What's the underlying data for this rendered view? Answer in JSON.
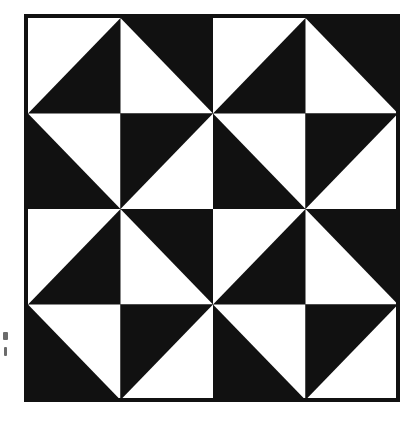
{
  "figure": {
    "title": "Half-Square Triangle Pinwheel Quilt Block",
    "description": "Monochrome scanned line-art diagram of a four-by-four grid of half-square triangle units forming interlocking pinwheel motifs.",
    "caption": ""
  },
  "canvas": {
    "width": 412,
    "height": 423,
    "background_color": "#ffffff"
  },
  "border": {
    "name": "outer-frame",
    "x": 26,
    "y": 16,
    "width": 372,
    "height": 384,
    "stroke_color": "#111111",
    "stroke_width": 4,
    "fill": "none"
  },
  "grid": {
    "rows": 4,
    "columns": 4,
    "origin_x": 28,
    "origin_y": 18,
    "cell_width": 92.5,
    "cell_height": 95.5,
    "ink_color": "#111111",
    "paper_color": "#ffffff",
    "unit_type": "half-square-triangle"
  },
  "legend": {
    "ink_label": "black",
    "paper_label": "white",
    "ink_color": "#111111",
    "paper_color": "#ffffff"
  },
  "chart_data": {
    "type": "heatmap",
    "title": "Half-Square Triangle Pinwheel Quilt Block",
    "xlabel": "",
    "ylabel": "",
    "rows": 4,
    "columns": 4,
    "categories": [
      "col-1",
      "col-2",
      "col-3",
      "col-4"
    ],
    "row_labels": [
      "row-1",
      "row-2",
      "row-3",
      "row-4"
    ],
    "value_key": "white_triangle_corner",
    "legend_position": "none",
    "grid": false,
    "cells": [
      [
        {
          "row": 0,
          "col": 0,
          "white_corner": "top-left",
          "black_corner": "bottom-right",
          "diagonal": "anti"
        },
        {
          "row": 0,
          "col": 1,
          "white_corner": "bottom-left",
          "black_corner": "top-right",
          "diagonal": "main"
        },
        {
          "row": 0,
          "col": 2,
          "white_corner": "top-left",
          "black_corner": "bottom-right",
          "diagonal": "anti"
        },
        {
          "row": 0,
          "col": 3,
          "white_corner": "bottom-left",
          "black_corner": "top-right",
          "diagonal": "main"
        }
      ],
      [
        {
          "row": 1,
          "col": 0,
          "white_corner": "top-right",
          "black_corner": "bottom-left",
          "diagonal": "main"
        },
        {
          "row": 1,
          "col": 1,
          "white_corner": "bottom-right",
          "black_corner": "top-left",
          "diagonal": "anti"
        },
        {
          "row": 1,
          "col": 2,
          "white_corner": "top-right",
          "black_corner": "bottom-left",
          "diagonal": "main"
        },
        {
          "row": 1,
          "col": 3,
          "white_corner": "bottom-right",
          "black_corner": "top-left",
          "diagonal": "anti"
        }
      ],
      [
        {
          "row": 2,
          "col": 0,
          "white_corner": "top-left",
          "black_corner": "bottom-right",
          "diagonal": "anti"
        },
        {
          "row": 2,
          "col": 1,
          "white_corner": "bottom-left",
          "black_corner": "top-right",
          "diagonal": "main"
        },
        {
          "row": 2,
          "col": 2,
          "white_corner": "top-left",
          "black_corner": "bottom-right",
          "diagonal": "anti"
        },
        {
          "row": 2,
          "col": 3,
          "white_corner": "bottom-left",
          "black_corner": "top-right",
          "diagonal": "main"
        }
      ],
      [
        {
          "row": 3,
          "col": 0,
          "white_corner": "top-right",
          "black_corner": "bottom-left",
          "diagonal": "main"
        },
        {
          "row": 3,
          "col": 1,
          "white_corner": "bottom-right",
          "black_corner": "top-left",
          "diagonal": "anti"
        },
        {
          "row": 3,
          "col": 2,
          "white_corner": "top-right",
          "black_corner": "bottom-left",
          "diagonal": "main"
        },
        {
          "row": 3,
          "col": 3,
          "white_corner": "bottom-right",
          "black_corner": "top-left",
          "diagonal": "anti"
        }
      ]
    ],
    "pattern_rows": [
      [
        "top-left",
        "bottom-left",
        "top-left",
        "bottom-left"
      ],
      [
        "top-right",
        "bottom-right",
        "top-right",
        "bottom-right"
      ],
      [
        "top-left",
        "bottom-left",
        "top-left",
        "bottom-left"
      ],
      [
        "top-right",
        "bottom-right",
        "top-right",
        "bottom-right"
      ]
    ]
  },
  "artifacts": [
    {
      "name": "scan-artifact-upper",
      "x": 3,
      "y": 332,
      "width": 5,
      "height": 8
    },
    {
      "name": "scan-artifact-lower",
      "x": 4,
      "y": 347,
      "width": 3,
      "height": 9
    }
  ]
}
